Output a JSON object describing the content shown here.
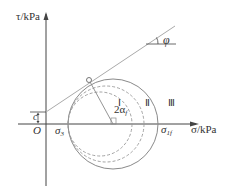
{
  "diagram": {
    "type": "mohr-coulomb-failure-envelope",
    "axes": {
      "y_label": "τ/kPa",
      "x_label": "σ/kPa",
      "origin_label": "O"
    },
    "labels": {
      "cohesion": "c",
      "friction_angle": "φ",
      "angle_2alpha": "2α",
      "angle_2alpha_sub": "f",
      "sigma3": "σ",
      "sigma3_sub": "3",
      "sigma1f": "σ",
      "sigma1f_sub": "1f"
    },
    "circles": [
      {
        "id": "I",
        "label": "Ⅰ",
        "style": "dashed"
      },
      {
        "id": "II",
        "label": "Ⅱ",
        "style": "dashed"
      },
      {
        "id": "III",
        "label": "Ⅲ",
        "style": "solid"
      }
    ],
    "colors": {
      "axis": "#444444",
      "envelope": "#aaaaaa",
      "circle": "#888888",
      "text": "#333333"
    }
  }
}
